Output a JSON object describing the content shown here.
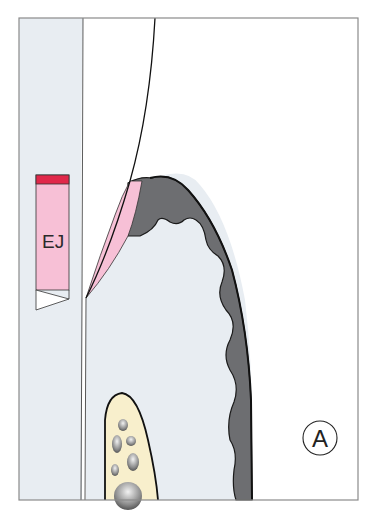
{
  "diagram": {
    "type": "anatomical-cross-section",
    "labels": {
      "junction_bar": "EJ",
      "panel": "A"
    },
    "colors": {
      "background": "#ffffff",
      "soft_tissue": "#e8edf2",
      "epithelium_pink": "#f7c0d6",
      "epithelium_top_band": "#e0284a",
      "dark_tissue": "#6d6e71",
      "bone": "#f8efcc",
      "outline": "#1a1a1a",
      "frame": "#8a8a8a"
    }
  }
}
